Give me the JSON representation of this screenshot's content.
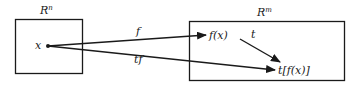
{
  "diagram": {
    "domain_set": {
      "label_base": "R",
      "label_sup": "n"
    },
    "codomain_set": {
      "label_base": "R",
      "label_sup": "m"
    },
    "points": {
      "x": "x",
      "fx": "f(x)",
      "tfx": "t[f(x)]"
    },
    "arrows": {
      "f": "f",
      "t": "t",
      "tf": "tf"
    },
    "colors": {
      "stroke": "#1a1a1a",
      "background": "#ffffff"
    }
  }
}
